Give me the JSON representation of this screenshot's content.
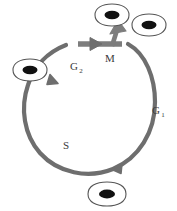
{
  "diagram": {
    "background_color": "#ffffff",
    "cycle_arrow_color": "#6e6e6e",
    "cell_outline_color": "#555555",
    "nucleus_color": "#000000",
    "label_color": "#3a3a3a",
    "phases": [
      {
        "id": "g1",
        "label": "G",
        "subscript": "1",
        "full_name": "G1",
        "position": "right"
      },
      {
        "id": "s",
        "label": "S",
        "subscript": "",
        "full_name": "S",
        "position": "lower-left"
      },
      {
        "id": "g2",
        "label": "G",
        "subscript": "2",
        "full_name": "G2",
        "position": "upper-left"
      },
      {
        "id": "m",
        "label": "M",
        "subscript": "",
        "full_name": "M",
        "position": "top"
      }
    ],
    "cells": [
      {
        "id": "parent-cell",
        "name": "parent-cell",
        "position": "bottom",
        "shape": "rounded-oval"
      },
      {
        "id": "interphase-cell",
        "name": "interphase-cell",
        "position": "left",
        "shape": "rounded-oval"
      },
      {
        "id": "daughter-cell-1",
        "name": "daughter-cell-1",
        "position": "top-left",
        "shape": "rounded-oval"
      },
      {
        "id": "daughter-cell-2",
        "name": "daughter-cell-2",
        "position": "top-right",
        "shape": "rounded-oval"
      }
    ],
    "arrows": [
      {
        "id": "arrow-to-interphase-cell",
        "direction": "up-left"
      },
      {
        "id": "arrow-into-g1",
        "direction": "left-down"
      },
      {
        "id": "arrow-m-entry",
        "direction": "right"
      },
      {
        "id": "arrow-to-daughter-cells",
        "direction": "up"
      }
    ]
  }
}
